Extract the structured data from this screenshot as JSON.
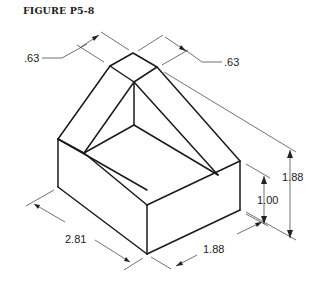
{
  "figure": {
    "title": "FIGURE P5-8"
  },
  "dimensions": {
    "top_left_width": ".63",
    "top_right_width": ".63",
    "overall_height": "1.88",
    "base_height": "1.00",
    "length": "2.81",
    "depth": "1.88"
  },
  "colors": {
    "line": "#1a1a1a",
    "background": "#ffffff"
  }
}
